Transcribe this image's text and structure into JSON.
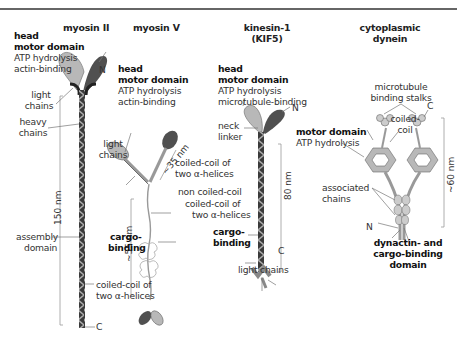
{
  "figure": {
    "motors": [
      {
        "title": "myosin II",
        "head_label": [
          "head",
          "motor domain"
        ],
        "head_desc": [
          "ATP hydrolysis",
          "actin-binding"
        ],
        "labels": {
          "n_terminus": "N",
          "light_chains": [
            "light",
            "chains"
          ],
          "heavy_chains": [
            "heavy",
            "chains"
          ],
          "length": "150 nm",
          "assembly_domain": [
            "assembly",
            "domain"
          ],
          "coiled_coil": [
            "coiled-coil of",
            "two α-helices"
          ],
          "c_terminus": "C"
        }
      },
      {
        "title": "myosin V",
        "head_label": [
          "head",
          "motor domain"
        ],
        "head_desc": [
          "ATP hydrolysis",
          "actin-binding"
        ],
        "labels": {
          "light_chains": [
            "light",
            "chains"
          ],
          "lever_length": "~35 nm",
          "stalk_length": "~55 nm",
          "coiled_coil_1": [
            "coiled-coil of",
            "two α-helices"
          ],
          "non_coiled": "non coiled-coil",
          "cargo_binding": [
            "cargo-",
            "binding"
          ]
        }
      },
      {
        "title": [
          "kinesin-1",
          "(KIF5)"
        ],
        "head_label": [
          "head",
          "motor domain"
        ],
        "head_desc": [
          "ATP hydrolysis",
          "microtubule-binding"
        ],
        "labels": {
          "n_terminus": "N",
          "neck_linker": [
            "neck",
            "linker"
          ],
          "length": "80 nm",
          "coiled_coil": [
            "coiled-coil of",
            "two α-helices"
          ],
          "cargo_binding": [
            "cargo-",
            "binding"
          ],
          "c_terminus": "C",
          "light_chains": "light chains"
        }
      },
      {
        "title": [
          "cytoplasmic",
          "dynein"
        ],
        "labels": {
          "stalks": [
            "microtubule",
            "binding stalks"
          ],
          "c_terminus": "C",
          "coiled_coil": [
            "coiled-",
            "coil"
          ],
          "motor_domain": "motor domain",
          "atp": "ATP hydrolysis",
          "length": "~60 nm",
          "associated_chains": [
            "associated",
            "chains"
          ],
          "n_terminus": "N",
          "dynactin": [
            "dynactin- and",
            "cargo-binding",
            "domain"
          ]
        }
      }
    ],
    "colors": {
      "light_head": "#b8b8b8",
      "dark_head": "#505050",
      "stalk_dark": "#3a3a3a",
      "stalk_light": "#a0a0a0",
      "leader": "#777777",
      "rule": "#666666"
    }
  }
}
